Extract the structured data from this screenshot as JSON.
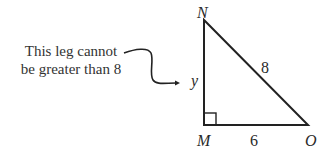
{
  "annotation": {
    "line1": "This leg cannot",
    "line2": "be greater than 8"
  },
  "triangle": {
    "vertices": {
      "top": "N",
      "right_angle": "M",
      "right": "O"
    },
    "sides": {
      "hypotenuse": "8",
      "base": "6",
      "leg": "y"
    },
    "right_angle_at": "M"
  }
}
